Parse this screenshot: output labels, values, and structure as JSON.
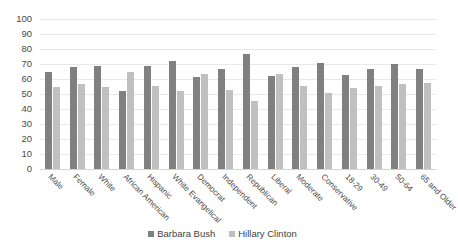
{
  "chart_data": {
    "type": "bar",
    "title": "",
    "subtitle": "",
    "xlabel": "",
    "ylabel": "",
    "ylim": [
      0,
      100
    ],
    "ytick_step": 10,
    "yticks": [
      100,
      90,
      80,
      70,
      60,
      50,
      40,
      30,
      20,
      10,
      0
    ],
    "grid": true,
    "legend_position": "bottom",
    "categories": [
      "Male",
      "Female",
      "White",
      "African American",
      "Hispanic",
      "White Evangelical",
      "Democrat",
      "Independent",
      "Republican",
      "Liberal",
      "Moderate",
      "Conservative",
      "18-29",
      "30-49",
      "50-64",
      "65 and Older"
    ],
    "series": [
      {
        "name": "Barbara Bush",
        "color": "#808080",
        "values": [
          65,
          68,
          69,
          52,
          69,
          72,
          61.5,
          67,
          76.5,
          62,
          68,
          71,
          62.5,
          66.5,
          70,
          67
        ]
      },
      {
        "name": "Hillary Clinton",
        "color": "#c0c0c0",
        "values": [
          54.5,
          57,
          54.5,
          64.5,
          55.5,
          52,
          63.5,
          53,
          45.5,
          63.5,
          55.5,
          50.5,
          54,
          55.5,
          56.5,
          57.5
        ]
      }
    ]
  }
}
